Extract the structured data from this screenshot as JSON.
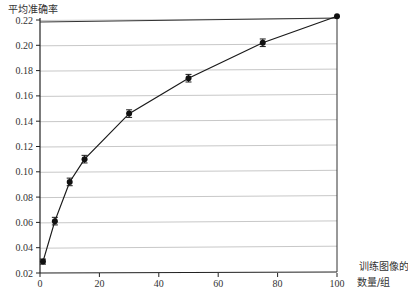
{
  "chart_data": {
    "type": "line",
    "title": "",
    "xlabel": "训练图像的数量/组",
    "xlabel_lines": [
      "训练图像的",
      "数量/组"
    ],
    "ylabel": "平均准确率",
    "xlim": [
      0,
      100
    ],
    "ylim": [
      0.02,
      0.22
    ],
    "xticks": [
      0,
      20,
      40,
      60,
      80,
      100
    ],
    "xtick_labels": [
      "0",
      "20",
      "40",
      "60",
      "80",
      "100"
    ],
    "yticks": [
      0.02,
      0.04,
      0.06,
      0.08,
      0.1,
      0.12,
      0.14,
      0.16,
      0.18,
      0.2,
      0.22
    ],
    "ytick_labels": [
      "0.02",
      "0.04",
      "0.06",
      "0.08",
      "0.10",
      "0.12",
      "0.14",
      "0.16",
      "0.18",
      "0.20",
      "0.22"
    ],
    "grid": "horizontal",
    "legend": null,
    "series": [
      {
        "name": "平均准确率",
        "marker": "circle",
        "error_bars": true,
        "x": [
          1,
          5,
          10,
          15,
          30,
          50,
          75,
          100
        ],
        "values": [
          0.029,
          0.061,
          0.092,
          0.11,
          0.146,
          0.174,
          0.202,
          0.223
        ],
        "error": [
          0.002,
          0.003,
          0.003,
          0.003,
          0.003,
          0.003,
          0.003,
          0.0
        ]
      }
    ],
    "caption_faint": "...训练图像数量"
  }
}
